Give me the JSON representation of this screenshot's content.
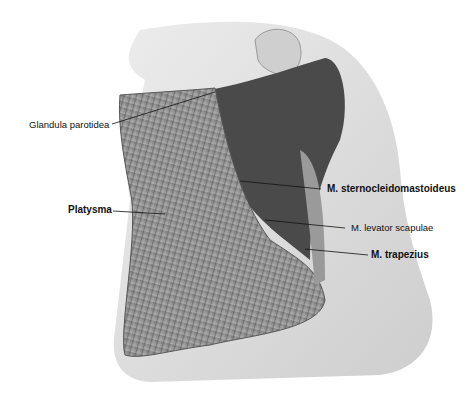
{
  "figure": {
    "colors": {
      "skin": "#d8d8d8",
      "muscle": "#8a8a8a",
      "dark": "#3a3a3a",
      "background": "#ffffff"
    }
  },
  "labels": [
    {
      "id": "glandula",
      "text": "Glandula parotidea",
      "bold": false
    },
    {
      "id": "platysma",
      "text": "Platysma",
      "bold": true
    },
    {
      "id": "scm",
      "text": "M. sternocleidomastoideus",
      "bold": true
    },
    {
      "id": "levator",
      "text": "M. levator scapulae",
      "bold": false
    },
    {
      "id": "trapezius",
      "text": "M. trapezius",
      "bold": true
    }
  ]
}
